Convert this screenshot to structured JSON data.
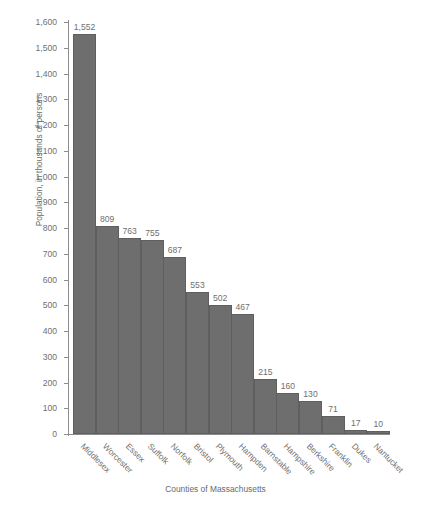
{
  "chart_data": {
    "type": "bar",
    "title": "",
    "xlabel": "Counties of Massachusetts",
    "ylabel": "Population, in thousands of persons",
    "categories": [
      "Middlesex",
      "Worcester",
      "Essex",
      "Suffolk",
      "Norfolk",
      "Bristol",
      "Plymouth",
      "Hampden",
      "Barnstable",
      "Hampshire",
      "Berkshire",
      "Franklin",
      "Dukes",
      "Nantucket"
    ],
    "values": [
      1552,
      809,
      763,
      755,
      687,
      553,
      502,
      467,
      215,
      160,
      130,
      71,
      17,
      10
    ],
    "value_labels": [
      "1,552",
      "809",
      "763",
      "755",
      "687",
      "553",
      "502",
      "467",
      "215",
      "160",
      "130",
      "71",
      "17",
      "10"
    ],
    "ylim": [
      0,
      1600
    ],
    "ytick_values": [
      0,
      100,
      200,
      300,
      400,
      500,
      600,
      700,
      800,
      900,
      1000,
      1100,
      1200,
      1300,
      1400,
      1500,
      1600
    ],
    "ytick_labels": [
      "0",
      "100",
      "200",
      "300",
      "400",
      "500",
      "600",
      "700",
      "800",
      "900",
      "1,000",
      "1,100",
      "1,200",
      "1,300",
      "1,400",
      "1,500",
      "1,600"
    ],
    "grid": false,
    "legend": null,
    "bar_color": "#6e6e6e",
    "axis_color": "#8d8d8d",
    "text_color": "#6f6f6f",
    "background": "#ffffff"
  }
}
